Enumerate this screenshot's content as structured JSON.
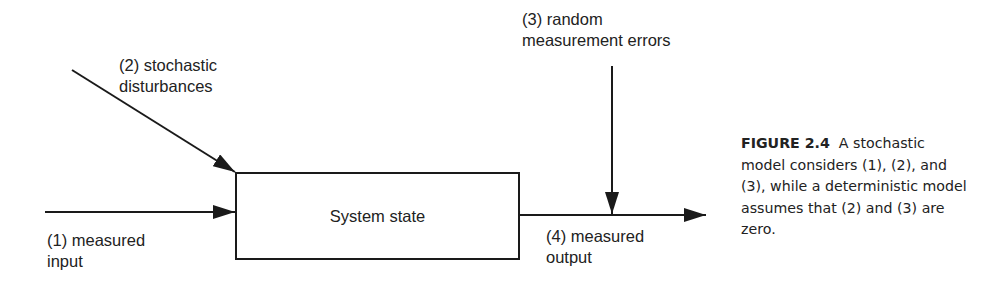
{
  "diagram": {
    "box": {
      "label": "System state"
    },
    "inputs": [
      {
        "id": "1",
        "label": "(1) measured\ninput"
      },
      {
        "id": "2",
        "label": "(2) stochastic\ndisturbances"
      },
      {
        "id": "3",
        "label": "(3) random\nmeasurement errors"
      }
    ],
    "output": {
      "id": "4",
      "label": "(4) measured\noutput"
    },
    "stroke_color": "#1a1a1a"
  },
  "caption": {
    "figure_label": "FIGURE 2.4",
    "text": "A stochastic model considers (1), (2), and (3), while a deterministic model assumes that (2) and (3) are zero."
  }
}
